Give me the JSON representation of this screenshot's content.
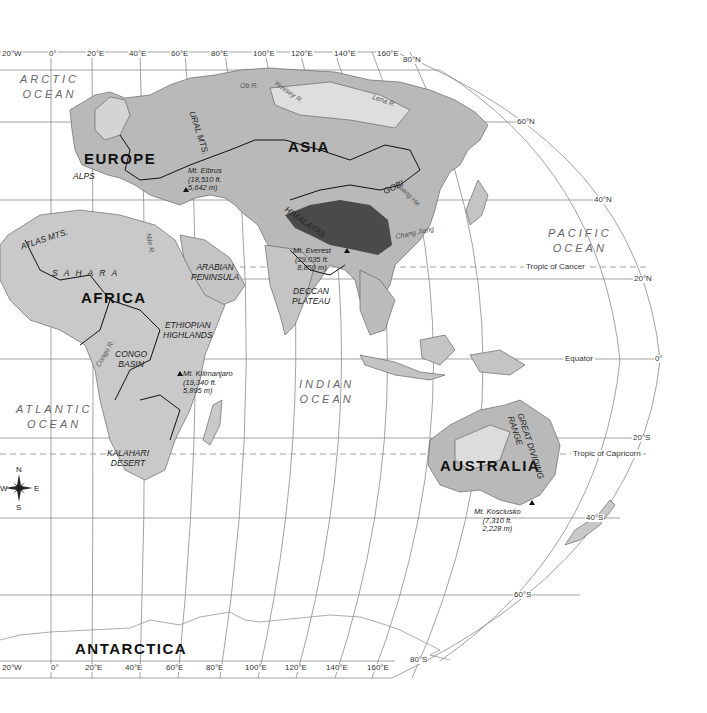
{
  "map": {
    "projection": "Robinson-style world map (Eastern Hemisphere)",
    "colors": {
      "land": "#b9b9b9",
      "land_light": "#dcdcdc",
      "highland": "#4a4a4a",
      "water": "#ffffff",
      "border": "#111111",
      "grid": "#888888"
    },
    "top_longitudes": [
      "20°W",
      "0°",
      "20°E",
      "40°E",
      "60°E",
      "80°E",
      "100°E",
      "120°E",
      "140°E",
      "160°E"
    ],
    "bottom_longitudes": [
      "20°W",
      "0°",
      "20°E",
      "40°E",
      "60°E",
      "80°E",
      "100°E",
      "120°E",
      "140°E",
      "160°E"
    ],
    "latitudes": {
      "n80": "80°N",
      "n60": "60°N",
      "n40": "40°N",
      "n20": "20°N",
      "eq": "0°",
      "s20": "20°S",
      "s40": "40°S",
      "s60": "60°S",
      "s80": "80°S"
    },
    "special_lines": {
      "tropic_cancer": "Tropic of Cancer",
      "equator": "Equator",
      "tropic_capricorn": "Tropic of Capricorn"
    },
    "oceans": {
      "arctic": [
        "ARCTIC",
        "OCEAN"
      ],
      "pacific": [
        "PACIFIC",
        "OCEAN"
      ],
      "atlantic": [
        "ATLANTIC",
        "OCEAN"
      ],
      "indian": [
        "INDIAN",
        "OCEAN"
      ]
    },
    "continents": {
      "europe": "EUROPE",
      "asia": "ASIA",
      "africa": "AFRICA",
      "australia": "AUSTRALIA",
      "antarctica": "ANTARCTICA"
    },
    "features": {
      "ural": "URAL MTS.",
      "alps": "ALPS",
      "atlas": "ATLAS MTS.",
      "sahara": "S A H A R A",
      "arabian": [
        "ARABIAN",
        "PENINSULA"
      ],
      "ethiopian": [
        "ETHIOPIAN",
        "HIGHLANDS"
      ],
      "congo": [
        "CONGO",
        "BASIN"
      ],
      "kalahari": [
        "KALAHARI",
        "DESERT"
      ],
      "himalayas": "HIMALAYAS",
      "deccan": [
        "DECCAN",
        "PLATEAU"
      ],
      "gobi": "GOBI",
      "great_dividing": [
        "GREAT DIVIDING",
        "RANGE"
      ]
    },
    "rivers": {
      "ob": "Ob R.",
      "lena": "Lena R.",
      "yenisey": "Yenisey R.",
      "huang": "Huang He",
      "chang": "Chang Jiang",
      "congo": "Congo R.",
      "nile": "Nile R."
    },
    "peaks": {
      "elbrus": [
        "Mt. Elbrus",
        "(18,510 ft.",
        "5,642 m)"
      ],
      "everest": [
        "Mt. Everest",
        "(29,035 ft.",
        "8,850 m)"
      ],
      "kilimanjaro": [
        "Mt. Kilimanjaro",
        "(19,340 ft.",
        "5,895 m)"
      ],
      "kosciusko": [
        "Mt. Kosciusko",
        "(7,310 ft.",
        "2,228 m)"
      ]
    },
    "compass": {
      "n": "N",
      "s": "S",
      "e": "E",
      "w": "W"
    }
  }
}
